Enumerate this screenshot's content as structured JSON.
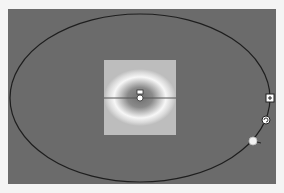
{
  "editor": {
    "type": "radial-gradient-shape-editor",
    "colors": {
      "canvas_bg": "#6b6b6b",
      "page_bg": "#f4f4f4",
      "ellipse_stroke": "#1e1e1e",
      "center_color": "#6e6e6e",
      "ring_color": "#f7f7f7",
      "outer_color": "#bdbdbd"
    },
    "ellipse": {
      "cx": 140,
      "cy": 98,
      "rx": 130,
      "ry": 84
    },
    "preview_square": {
      "x": 104,
      "y": 60,
      "width": 72,
      "height": 75
    },
    "center_handle": {
      "x": 140,
      "y": 96
    },
    "handles": [
      {
        "name": "resize-handle",
        "icon": "square-resize-icon",
        "x": 270,
        "y": 98
      },
      {
        "name": "rotate-handle",
        "icon": "rotate-icon",
        "x": 266,
        "y": 120
      },
      {
        "name": "stretch-handle",
        "icon": "circle-dot-icon",
        "x": 253,
        "y": 141
      }
    ]
  }
}
